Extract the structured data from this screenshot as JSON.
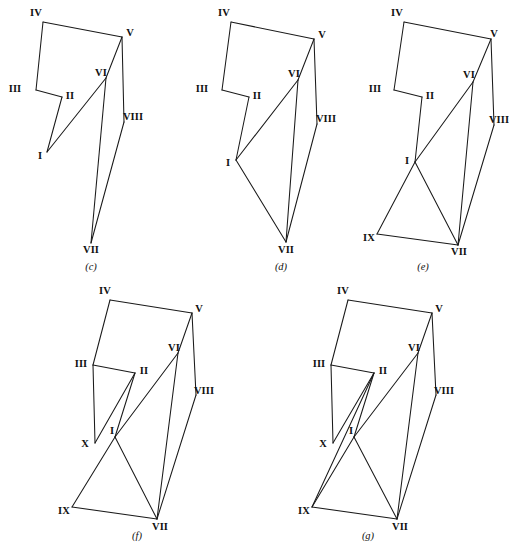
{
  "plate": {
    "title": "Polygon construction sequence",
    "background_color": "#ffffff",
    "line_color": "#1a1a1a",
    "text_color": "#111111",
    "width": 505,
    "height": 555,
    "footnote": ""
  },
  "figures": [
    {
      "id": "figure-c",
      "caption_letter": "c",
      "caption_text": "(c)",
      "caption_pos": {
        "x": 91,
        "y": 266
      },
      "vertices": [
        {
          "name": "IV",
          "x": 43,
          "y": 22,
          "label": "IV",
          "label_x": 36,
          "label_y": 13
        },
        {
          "name": "V",
          "x": 122,
          "y": 37,
          "label": "V",
          "label_x": 130,
          "label_y": 33
        },
        {
          "name": "III",
          "x": 36,
          "y": 90,
          "label": "III",
          "label_x": 15,
          "label_y": 89
        },
        {
          "name": "II",
          "x": 62,
          "y": 97,
          "label": "II",
          "label_x": 70,
          "label_y": 96
        },
        {
          "name": "VI",
          "x": 106,
          "y": 78,
          "label": "VI",
          "label_x": 101,
          "label_y": 73
        },
        {
          "name": "I",
          "x": 47,
          "y": 152,
          "label": "I",
          "label_x": 40,
          "label_y": 156
        },
        {
          "name": "VIII",
          "x": 124,
          "y": 122,
          "label": "VIII",
          "label_x": 133,
          "label_y": 117
        },
        {
          "name": "VII",
          "x": 91,
          "y": 243,
          "label": "VII",
          "label_x": 91,
          "label_y": 250
        }
      ],
      "edges": [
        [
          "IV",
          "V"
        ],
        [
          "IV",
          "III"
        ],
        [
          "III",
          "II"
        ],
        [
          "II",
          "I"
        ],
        [
          "I",
          "VI"
        ],
        [
          "VI",
          "V"
        ],
        [
          "V",
          "VIII"
        ],
        [
          "VI",
          "VII"
        ],
        [
          "VIII",
          "VII"
        ]
      ]
    },
    {
      "id": "figure-d",
      "caption_letter": "d",
      "caption_text": "(d)",
      "caption_pos": {
        "x": 281,
        "y": 266
      },
      "vertices": [
        {
          "name": "IV",
          "x": 231,
          "y": 22,
          "label": "IV",
          "label_x": 224,
          "label_y": 13
        },
        {
          "name": "V",
          "x": 314,
          "y": 39,
          "label": "V",
          "label_x": 322,
          "label_y": 35
        },
        {
          "name": "III",
          "x": 222,
          "y": 90,
          "label": "III",
          "label_x": 202,
          "label_y": 89
        },
        {
          "name": "II",
          "x": 249,
          "y": 97,
          "label": "II",
          "label_x": 257,
          "label_y": 96
        },
        {
          "name": "VI",
          "x": 298,
          "y": 80,
          "label": "VI",
          "label_x": 294,
          "label_y": 74
        },
        {
          "name": "I",
          "x": 236,
          "y": 160,
          "label": "I",
          "label_x": 228,
          "label_y": 163
        },
        {
          "name": "VIII",
          "x": 317,
          "y": 124,
          "label": "VIII",
          "label_x": 326,
          "label_y": 119
        },
        {
          "name": "VII",
          "x": 286,
          "y": 242,
          "label": "VII",
          "label_x": 286,
          "label_y": 250
        }
      ],
      "edges": [
        [
          "IV",
          "V"
        ],
        [
          "IV",
          "III"
        ],
        [
          "III",
          "II"
        ],
        [
          "II",
          "I"
        ],
        [
          "I",
          "VI"
        ],
        [
          "VI",
          "V"
        ],
        [
          "V",
          "VIII"
        ],
        [
          "VI",
          "VII"
        ],
        [
          "VIII",
          "VII"
        ],
        [
          "I",
          "VII"
        ]
      ]
    },
    {
      "id": "figure-e",
      "caption_letter": "e",
      "caption_text": "(e)",
      "caption_pos": {
        "x": 423,
        "y": 266
      },
      "vertices": [
        {
          "name": "IV",
          "x": 404,
          "y": 22,
          "label": "IV",
          "label_x": 397,
          "label_y": 13
        },
        {
          "name": "V",
          "x": 491,
          "y": 39,
          "label": "V",
          "label_x": 494,
          "label_y": 34
        },
        {
          "name": "III",
          "x": 394,
          "y": 90,
          "label": "III",
          "label_x": 375,
          "label_y": 89
        },
        {
          "name": "II",
          "x": 422,
          "y": 97,
          "label": "II",
          "label_x": 430,
          "label_y": 96
        },
        {
          "name": "VI",
          "x": 473,
          "y": 82,
          "label": "VI",
          "label_x": 469,
          "label_y": 75
        },
        {
          "name": "I",
          "x": 415,
          "y": 162,
          "label": "I",
          "label_x": 407,
          "label_y": 161
        },
        {
          "name": "VIII",
          "x": 494,
          "y": 125,
          "label": "VIII",
          "label_x": 499,
          "label_y": 120
        },
        {
          "name": "IX",
          "x": 377,
          "y": 234,
          "label": "IX",
          "label_x": 369,
          "label_y": 238
        },
        {
          "name": "VII",
          "x": 458,
          "y": 245,
          "label": "VII",
          "label_x": 459,
          "label_y": 252
        }
      ],
      "edges": [
        [
          "IV",
          "V"
        ],
        [
          "IV",
          "III"
        ],
        [
          "III",
          "II"
        ],
        [
          "II",
          "I"
        ],
        [
          "I",
          "VI"
        ],
        [
          "VI",
          "V"
        ],
        [
          "V",
          "VIII"
        ],
        [
          "VI",
          "VII"
        ],
        [
          "VIII",
          "VII"
        ],
        [
          "I",
          "VII"
        ],
        [
          "I",
          "IX"
        ],
        [
          "IX",
          "VII"
        ]
      ]
    },
    {
      "id": "figure-f",
      "caption_letter": "f",
      "caption_text": "(f)",
      "caption_pos": {
        "x": 137,
        "y": 535
      },
      "vertices": [
        {
          "name": "IV",
          "x": 110,
          "y": 300,
          "label": "IV",
          "label_x": 105,
          "label_y": 291
        },
        {
          "name": "V",
          "x": 192,
          "y": 313,
          "label": "V",
          "label_x": 199,
          "label_y": 309
        },
        {
          "name": "III",
          "x": 93,
          "y": 365,
          "label": "III",
          "label_x": 81,
          "label_y": 364
        },
        {
          "name": "II",
          "x": 135,
          "y": 373,
          "label": "II",
          "label_x": 144,
          "label_y": 371
        },
        {
          "name": "VI",
          "x": 178,
          "y": 353,
          "label": "VI",
          "label_x": 174,
          "label_y": 348
        },
        {
          "name": "X",
          "x": 95,
          "y": 443,
          "label": "X",
          "label_x": 85,
          "label_y": 444
        },
        {
          "name": "I",
          "x": 115,
          "y": 437,
          "label": "I",
          "label_x": 112,
          "label_y": 431
        },
        {
          "name": "VIII",
          "x": 196,
          "y": 395,
          "label": "VIII",
          "label_x": 204,
          "label_y": 391
        },
        {
          "name": "IX",
          "x": 72,
          "y": 507,
          "label": "IX",
          "label_x": 64,
          "label_y": 511
        },
        {
          "name": "VII",
          "x": 157,
          "y": 519,
          "label": "VII",
          "label_x": 160,
          "label_y": 527
        }
      ],
      "edges": [
        [
          "IV",
          "V"
        ],
        [
          "IV",
          "III"
        ],
        [
          "III",
          "II"
        ],
        [
          "III",
          "X"
        ],
        [
          "II",
          "X"
        ],
        [
          "II",
          "I"
        ],
        [
          "I",
          "VI"
        ],
        [
          "VI",
          "V"
        ],
        [
          "V",
          "VIII"
        ],
        [
          "VI",
          "VII"
        ],
        [
          "VIII",
          "VII"
        ],
        [
          "I",
          "VII"
        ],
        [
          "I",
          "IX"
        ],
        [
          "IX",
          "VII"
        ]
      ]
    },
    {
      "id": "figure-g",
      "caption_letter": "g",
      "caption_text": "(g)",
      "caption_pos": {
        "x": 368,
        "y": 535
      },
      "vertices": [
        {
          "name": "IV",
          "x": 348,
          "y": 300,
          "label": "IV",
          "label_x": 343,
          "label_y": 291
        },
        {
          "name": "V",
          "x": 432,
          "y": 313,
          "label": "V",
          "label_x": 439,
          "label_y": 309
        },
        {
          "name": "III",
          "x": 331,
          "y": 365,
          "label": "III",
          "label_x": 319,
          "label_y": 364
        },
        {
          "name": "II",
          "x": 374,
          "y": 373,
          "label": "II",
          "label_x": 383,
          "label_y": 371
        },
        {
          "name": "VI",
          "x": 418,
          "y": 353,
          "label": "VI",
          "label_x": 414,
          "label_y": 348
        },
        {
          "name": "X",
          "x": 333,
          "y": 443,
          "label": "X",
          "label_x": 323,
          "label_y": 444
        },
        {
          "name": "I",
          "x": 354,
          "y": 437,
          "label": "I",
          "label_x": 351,
          "label_y": 431
        },
        {
          "name": "VIII",
          "x": 436,
          "y": 395,
          "label": "VIII",
          "label_x": 444,
          "label_y": 391
        },
        {
          "name": "IX",
          "x": 312,
          "y": 507,
          "label": "IX",
          "label_x": 304,
          "label_y": 511
        },
        {
          "name": "VII",
          "x": 397,
          "y": 519,
          "label": "VII",
          "label_x": 400,
          "label_y": 527
        }
      ],
      "edges": [
        [
          "IV",
          "V"
        ],
        [
          "IV",
          "III"
        ],
        [
          "III",
          "II"
        ],
        [
          "III",
          "X"
        ],
        [
          "II",
          "X"
        ],
        [
          "II",
          "I"
        ],
        [
          "II",
          "IX"
        ],
        [
          "I",
          "VI"
        ],
        [
          "VI",
          "V"
        ],
        [
          "V",
          "VIII"
        ],
        [
          "VI",
          "VII"
        ],
        [
          "VIII",
          "VII"
        ],
        [
          "I",
          "VII"
        ],
        [
          "I",
          "IX"
        ],
        [
          "IX",
          "VII"
        ]
      ]
    }
  ]
}
